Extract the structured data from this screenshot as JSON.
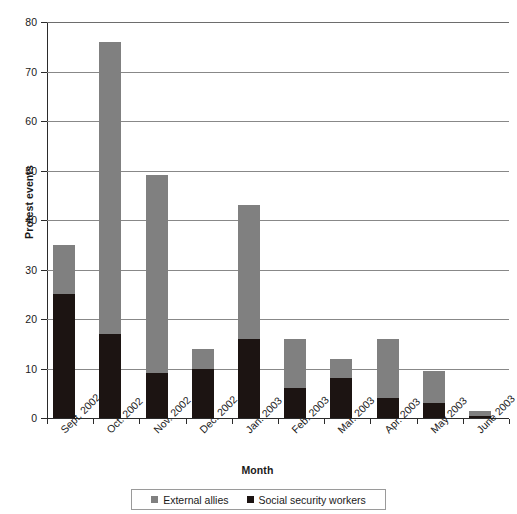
{
  "chart_data": {
    "type": "bar",
    "subtype": "stacked-bar",
    "title": "",
    "xlabel": "Month",
    "ylabel": "Protest events",
    "ylim": [
      0,
      80
    ],
    "ytick_step": 10,
    "yticks": [
      0,
      10,
      20,
      30,
      40,
      50,
      60,
      70,
      80
    ],
    "ytick_labels": [
      "0",
      "10",
      "20",
      "30",
      "40",
      "50",
      "60",
      "70",
      "80"
    ],
    "grid": true,
    "grid_axis": "y",
    "legend_position": "bottom",
    "categories": [
      "Sept. 2002",
      "Oct. 2002",
      "Nov. 2002",
      "Dec. 2002",
      "Jan. 2003",
      "Feb. 2003",
      "Mar. 2003",
      "Apr. 2003",
      "May 2003",
      "June 2003"
    ],
    "series": [
      {
        "name": "Social security workers",
        "color": "#1c1412",
        "values": [
          25,
          17,
          9,
          10,
          16,
          6,
          8,
          4,
          3,
          0.4
        ]
      },
      {
        "name": "External allies",
        "color": "#808080",
        "values": [
          10,
          59,
          40,
          4,
          27,
          10,
          4,
          12,
          6.5,
          1.1
        ]
      }
    ],
    "totals": [
      35,
      76,
      49,
      14,
      43,
      16,
      12,
      16,
      9.5,
      1.5
    ]
  },
  "legend": {
    "items": [
      {
        "label": "External allies",
        "color": "#808080"
      },
      {
        "label": "Social security workers",
        "color": "#1c1412"
      }
    ]
  },
  "axes": {
    "y_title": "Protest events",
    "x_title": "Month"
  }
}
